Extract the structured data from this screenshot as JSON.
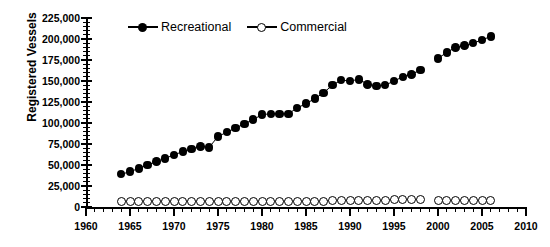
{
  "chart_data": {
    "type": "line",
    "title": "",
    "xlabel": "",
    "ylabel": "Registered Vessels",
    "xlim": [
      1960,
      2010
    ],
    "ylim": [
      0,
      225000
    ],
    "ytick_labels": [
      "225,000",
      "200,000",
      "175,000",
      "150,000",
      "125,000",
      "100,000",
      "75,000",
      "50,000",
      "25,000",
      "0"
    ],
    "ytick_values": [
      225000,
      200000,
      175000,
      150000,
      125000,
      100000,
      75000,
      50000,
      25000,
      0
    ],
    "ytick_step": 25000,
    "yminor_step": 5000,
    "xtick_labels": [
      "1960",
      "1965",
      "1970",
      "1975",
      "1980",
      "1985",
      "1990",
      "1995",
      "2000",
      "2005",
      "2010"
    ],
    "xtick_values": [
      1960,
      1965,
      1970,
      1975,
      1980,
      1985,
      1990,
      1995,
      2000,
      2005,
      2010
    ],
    "xminor_step": 1,
    "grid": false,
    "legend_position": "top-center",
    "series": [
      {
        "name": "Recreational",
        "marker": "filled-circle",
        "color": "#000000",
        "x": [
          1964,
          1965,
          1966,
          1967,
          1968,
          1969,
          1970,
          1971,
          1972,
          1973,
          1974,
          1975,
          1976,
          1977,
          1978,
          1979,
          1980,
          1981,
          1982,
          1983,
          1984,
          1985,
          1986,
          1987,
          1988,
          1989,
          1990,
          1991,
          1992,
          1993,
          1994,
          1995,
          1996,
          1997,
          1998,
          2000,
          2001,
          2002,
          2003,
          2004,
          2005,
          2006
        ],
        "values": [
          39000,
          42000,
          46000,
          50000,
          54000,
          58000,
          62000,
          66000,
          69000,
          72000,
          71000,
          84000,
          89000,
          94000,
          99000,
          104000,
          110000,
          111000,
          111000,
          111000,
          118000,
          123000,
          129000,
          136000,
          145000,
          151000,
          150000,
          152000,
          146000,
          144000,
          145000,
          150000,
          155000,
          158000,
          163000,
          177000,
          184000,
          190000,
          192000,
          195000,
          199000,
          203000
        ]
      },
      {
        "name": "Commercial",
        "marker": "open-circle",
        "color": "#000000",
        "x": [
          1964,
          1965,
          1966,
          1967,
          1968,
          1969,
          1970,
          1971,
          1972,
          1973,
          1974,
          1975,
          1976,
          1977,
          1978,
          1979,
          1980,
          1981,
          1982,
          1983,
          1984,
          1985,
          1986,
          1987,
          1988,
          1989,
          1990,
          1991,
          1992,
          1993,
          1994,
          1995,
          1996,
          1997,
          1998,
          2000,
          2001,
          2002,
          2003,
          2004,
          2005,
          2006
        ],
        "values": [
          7000,
          7000,
          7000,
          7000,
          7000,
          7000,
          7000,
          7000,
          7000,
          7000,
          7000,
          7000,
          7000,
          7000,
          7000,
          7000,
          7000,
          7000,
          7000,
          7000,
          7000,
          7000,
          7000,
          7000,
          8000,
          8000,
          8000,
          8000,
          8000,
          8000,
          8000,
          9000,
          9000,
          9000,
          9000,
          8000,
          8000,
          8000,
          8000,
          8000,
          8000,
          8000
        ]
      }
    ]
  },
  "legend": {
    "entries": [
      {
        "label": "Recreational",
        "marker": "filled-circle"
      },
      {
        "label": "Commercial",
        "marker": "open-circle"
      }
    ]
  }
}
